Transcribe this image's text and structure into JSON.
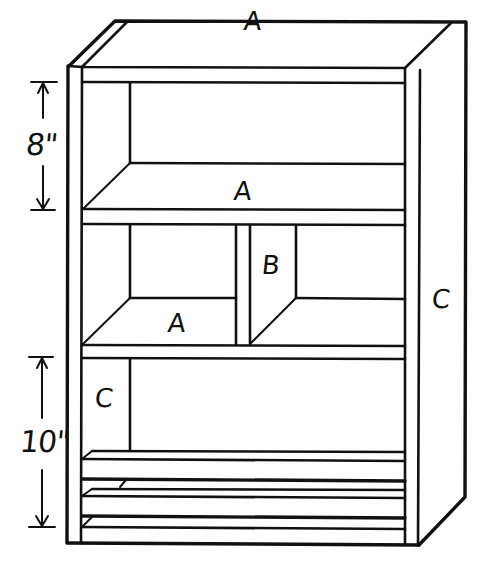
{
  "diagram": {
    "type": "bookcase-assembly-drawing",
    "colors": {
      "line": "#111111",
      "background": "#ffffff"
    },
    "part_labels": [
      {
        "id": "top-a",
        "text": "A",
        "x": 244,
        "y": 8
      },
      {
        "id": "upper-shelf-a",
        "text": "A",
        "x": 234,
        "y": 178
      },
      {
        "id": "lower-left-shelf-a",
        "text": "A",
        "x": 168,
        "y": 310
      },
      {
        "id": "divider-b",
        "text": "B",
        "x": 262,
        "y": 252
      },
      {
        "id": "right-side-c",
        "text": "C",
        "x": 432,
        "y": 286
      },
      {
        "id": "bottom-left-c",
        "text": "C",
        "x": 95,
        "y": 385
      }
    ],
    "dimensions": [
      {
        "id": "upper-spacing",
        "text": "8\"",
        "x": 26,
        "y": 130
      },
      {
        "id": "lower-spacing",
        "text": "10\"",
        "x": 22,
        "y": 427
      }
    ]
  }
}
